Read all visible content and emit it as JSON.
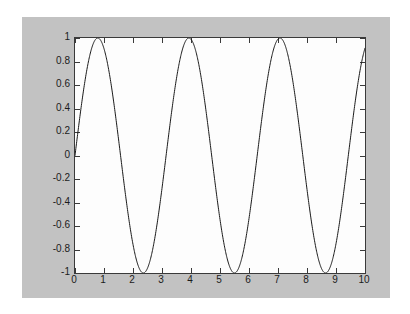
{
  "window": {
    "title": "plot",
    "figure_background": "#c2c2c2",
    "page_background": "#ffffff",
    "axes_background": "#fdfdfd",
    "axes_border_color": "#3a3a3a",
    "line_color": "#1a1a1a"
  },
  "chart_data": {
    "type": "line",
    "title": "",
    "xlabel": "",
    "ylabel": "",
    "xlim": [
      0,
      10
    ],
    "ylim": [
      -1,
      1
    ],
    "xticks": [
      0,
      1,
      2,
      3,
      4,
      5,
      6,
      7,
      8,
      9,
      10
    ],
    "yticks": [
      -1,
      -0.8,
      -0.6,
      -0.4,
      -0.2,
      0,
      0.2,
      0.4,
      0.6,
      0.8,
      1
    ],
    "xtick_labels": [
      "0",
      "1",
      "2",
      "3",
      "4",
      "5",
      "6",
      "7",
      "8",
      "9",
      "10"
    ],
    "ytick_labels": [
      "-1",
      "-0.8",
      "-0.6",
      "-0.4",
      "-0.2",
      "0",
      "0.2",
      "0.4",
      "0.6",
      "0.8",
      "1"
    ],
    "grid": false,
    "legend": null,
    "box": true,
    "tick_direction": "in",
    "series": [
      {
        "name": "sin(2x)",
        "expression": "y = sin(2*x)",
        "color": "#1a1a1a",
        "line_width": 1,
        "x": [
          0,
          0.2,
          0.4,
          0.6,
          0.785,
          1.0,
          1.2,
          1.4,
          1.571,
          1.8,
          2.0,
          2.2,
          2.356,
          2.6,
          2.8,
          3.0,
          3.142,
          3.4,
          3.6,
          3.8,
          3.927,
          4.2,
          4.4,
          4.6,
          4.712,
          5.0,
          5.2,
          5.4,
          5.498,
          5.8,
          6.0,
          6.2,
          6.283,
          6.6,
          6.8,
          7.0,
          7.069,
          7.4,
          7.6,
          7.8,
          7.854,
          8.2,
          8.4,
          8.6,
          8.639,
          9.0,
          9.2,
          9.4,
          9.425,
          9.8,
          10.0
        ],
        "y": [
          0,
          0.389,
          0.717,
          0.932,
          1,
          0.909,
          0.675,
          0.335,
          0,
          -0.443,
          -0.757,
          -0.951,
          -1,
          -0.943,
          -0.675,
          -0.279,
          0,
          0.492,
          0.793,
          0.971,
          1,
          0.872,
          0.603,
          0.227,
          0,
          -0.544,
          -0.831,
          -0.99,
          -1,
          -0.908,
          -0.536,
          -0.089,
          0,
          0.59,
          0.857,
          0.99,
          1,
          0.826,
          0.521,
          0.113,
          0,
          -0.615,
          -0.899,
          -0.999,
          -1,
          -0.751,
          -0.438,
          -0.052,
          0,
          0.795,
          0.913
        ],
        "points": 1000
      }
    ]
  },
  "axes_geometry": {
    "left": 74,
    "top": 37,
    "width": 290,
    "height": 235
  }
}
